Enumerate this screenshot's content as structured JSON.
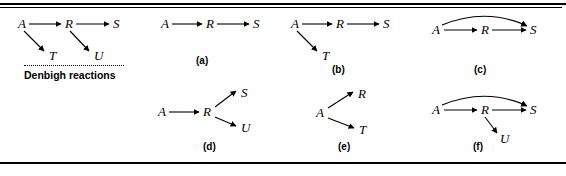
{
  "figure": {
    "background_color": "#ffffff",
    "line_color": "#000000",
    "rules": {
      "top_thick": "",
      "top_thin": "",
      "bottom": ""
    }
  },
  "panels": [
    {
      "id": "denbigh",
      "caption": "",
      "note": "Denbigh reactions",
      "nodes": [
        {
          "name": "A",
          "label": "A"
        },
        {
          "name": "R",
          "label": "R"
        },
        {
          "name": "S",
          "label": "S"
        },
        {
          "name": "T",
          "label": "T"
        },
        {
          "name": "U",
          "label": "U"
        }
      ],
      "edges": [
        {
          "from": "A",
          "to": "R",
          "style": "straight"
        },
        {
          "from": "R",
          "to": "S",
          "style": "straight"
        },
        {
          "from": "A",
          "to": "T",
          "style": "straight"
        },
        {
          "from": "R",
          "to": "U",
          "style": "straight"
        }
      ]
    },
    {
      "id": "a",
      "caption": "(a)",
      "note": "",
      "nodes": [
        {
          "name": "A",
          "label": "A"
        },
        {
          "name": "R",
          "label": "R"
        },
        {
          "name": "S",
          "label": "S"
        }
      ],
      "edges": [
        {
          "from": "A",
          "to": "R",
          "style": "straight"
        },
        {
          "from": "R",
          "to": "S",
          "style": "straight"
        }
      ]
    },
    {
      "id": "b",
      "caption": "(b)",
      "note": "",
      "nodes": [
        {
          "name": "A",
          "label": "A"
        },
        {
          "name": "R",
          "label": "R"
        },
        {
          "name": "S",
          "label": "S"
        },
        {
          "name": "T",
          "label": "T"
        }
      ],
      "edges": [
        {
          "from": "A",
          "to": "R",
          "style": "straight"
        },
        {
          "from": "R",
          "to": "S",
          "style": "straight"
        },
        {
          "from": "A",
          "to": "T",
          "style": "straight"
        }
      ]
    },
    {
      "id": "c",
      "caption": "(c)",
      "note": "",
      "nodes": [
        {
          "name": "A",
          "label": "A"
        },
        {
          "name": "R",
          "label": "R"
        },
        {
          "name": "S",
          "label": "S"
        }
      ],
      "edges": [
        {
          "from": "A",
          "to": "R",
          "style": "straight"
        },
        {
          "from": "R",
          "to": "S",
          "style": "straight"
        },
        {
          "from": "A",
          "to": "S",
          "style": "arc"
        }
      ]
    },
    {
      "id": "d",
      "caption": "(d)",
      "note": "",
      "nodes": [
        {
          "name": "A",
          "label": "A"
        },
        {
          "name": "R",
          "label": "R"
        },
        {
          "name": "S",
          "label": "S"
        },
        {
          "name": "U",
          "label": "U"
        }
      ],
      "edges": [
        {
          "from": "A",
          "to": "R",
          "style": "straight"
        },
        {
          "from": "R",
          "to": "S",
          "style": "straight"
        },
        {
          "from": "R",
          "to": "U",
          "style": "straight"
        }
      ]
    },
    {
      "id": "e",
      "caption": "(e)",
      "note": "",
      "nodes": [
        {
          "name": "A",
          "label": "A"
        },
        {
          "name": "R",
          "label": "R"
        },
        {
          "name": "T",
          "label": "T"
        }
      ],
      "edges": [
        {
          "from": "A",
          "to": "R",
          "style": "straight"
        },
        {
          "from": "A",
          "to": "T",
          "style": "straight"
        }
      ]
    },
    {
      "id": "f",
      "caption": "(f)",
      "note": "",
      "nodes": [
        {
          "name": "A",
          "label": "A"
        },
        {
          "name": "R",
          "label": "R"
        },
        {
          "name": "S",
          "label": "S"
        },
        {
          "name": "U",
          "label": "U"
        }
      ],
      "edges": [
        {
          "from": "A",
          "to": "R",
          "style": "straight"
        },
        {
          "from": "R",
          "to": "S",
          "style": "straight"
        },
        {
          "from": "A",
          "to": "S",
          "style": "arc"
        },
        {
          "from": "R",
          "to": "U",
          "style": "straight"
        }
      ]
    }
  ]
}
